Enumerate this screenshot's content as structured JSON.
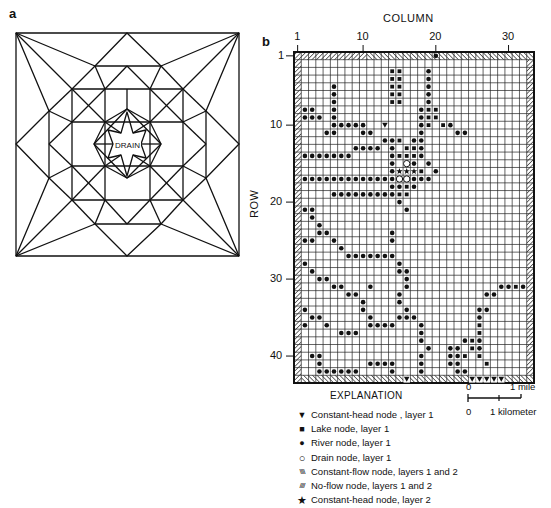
{
  "panels": {
    "a": {
      "label": "a",
      "drain_label": "DRAIN"
    },
    "b": {
      "label": "b",
      "column_title": "COLUMN",
      "row_title": "ROW",
      "n_rows": 43,
      "n_cols": 33,
      "column_ticks": [
        {
          "label": "1",
          "col": 1
        },
        {
          "label": "10",
          "col": 10
        },
        {
          "label": "20",
          "col": 20
        },
        {
          "label": "30",
          "col": 30
        }
      ],
      "row_ticks": [
        {
          "label": "1",
          "row": 1
        },
        {
          "label": "10",
          "row": 10
        },
        {
          "label": "20",
          "row": 20
        },
        {
          "label": "30",
          "row": 30
        },
        {
          "label": "40",
          "row": 40
        }
      ]
    }
  },
  "explanation": {
    "title": "EXPLANATION",
    "items": [
      {
        "symbol": "▼",
        "symbol_name": "constant-head-triangle-icon",
        "label": "Constant-head node , layer 1"
      },
      {
        "symbol": "■",
        "symbol_name": "lake-square-icon",
        "label": "Lake node, layer 1"
      },
      {
        "symbol": "●",
        "symbol_name": "river-dot-icon",
        "label": "River node, layer 1"
      },
      {
        "symbol": "○",
        "symbol_name": "drain-circle-icon",
        "label": "Drain node, layer 1"
      },
      {
        "symbol": "\\\\\\\\",
        "symbol_name": "constant-flow-hatch-icon",
        "label": "Constant-flow node, layers 1 and 2"
      },
      {
        "symbol": "////",
        "symbol_name": "no-flow-hatch-icon",
        "label": "No-flow node, layers 1 and 2"
      },
      {
        "symbol": "★",
        "symbol_name": "constant-head-star-icon",
        "label": "Constant-head node, layer 2"
      }
    ]
  },
  "scale_bar": {
    "mile_zero": "0",
    "mile_label": "1 mile",
    "km_zero": "0",
    "km_label": "1 kilometer"
  },
  "chart_data": {
    "type": "grid-map",
    "title": "",
    "xlabel": "COLUMN",
    "ylabel": "ROW",
    "x_range": [
      1,
      33
    ],
    "y_range": [
      1,
      43
    ],
    "boundary": {
      "constant_flow": "left column, right column, top row columns 1-10",
      "no_flow": "top row columns 11-33, bottom row"
    },
    "constant_head_layer1": [
      [
        10,
        13
      ],
      [
        43,
        16
      ],
      [
        43,
        25
      ],
      [
        43,
        26
      ],
      [
        43,
        27
      ],
      [
        43,
        28
      ],
      [
        43,
        29
      ]
    ],
    "constant_head_layer2": [
      [
        16,
        15
      ],
      [
        16,
        16
      ],
      [
        16,
        17
      ]
    ],
    "drain": [
      [
        15,
        16
      ],
      [
        17,
        15
      ],
      [
        17,
        16
      ]
    ],
    "lake": [
      [
        3,
        14
      ],
      [
        3,
        15
      ],
      [
        4,
        14
      ],
      [
        4,
        15
      ],
      [
        5,
        14
      ],
      [
        5,
        15
      ],
      [
        6,
        14
      ],
      [
        6,
        15
      ],
      [
        7,
        14
      ],
      [
        7,
        15
      ],
      [
        8,
        19
      ],
      [
        8,
        20
      ],
      [
        9,
        19
      ],
      [
        9,
        20
      ],
      [
        10,
        19
      ],
      [
        12,
        15
      ],
      [
        13,
        16
      ],
      [
        13,
        17
      ],
      [
        14,
        15
      ],
      [
        14,
        16
      ],
      [
        14,
        17
      ],
      [
        16,
        18
      ],
      [
        18,
        16
      ],
      [
        19,
        15
      ],
      [
        19,
        16
      ],
      [
        10,
        21
      ],
      [
        31,
        31
      ],
      [
        36,
        26
      ],
      [
        37,
        26
      ],
      [
        38,
        25
      ],
      [
        39,
        25
      ],
      [
        40,
        24
      ],
      [
        40,
        26
      ],
      [
        41,
        27
      ]
    ],
    "river": [
      [
        1,
        20
      ],
      [
        3,
        19
      ],
      [
        4,
        19
      ],
      [
        5,
        19
      ],
      [
        6,
        19
      ],
      [
        7,
        19
      ],
      [
        8,
        18
      ],
      [
        9,
        18
      ],
      [
        10,
        18
      ],
      [
        11,
        18
      ],
      [
        5,
        6
      ],
      [
        6,
        6
      ],
      [
        7,
        6
      ],
      [
        8,
        6
      ],
      [
        9,
        6
      ],
      [
        9,
        2
      ],
      [
        9,
        3
      ],
      [
        9,
        4
      ],
      [
        10,
        6
      ],
      [
        10,
        7
      ],
      [
        10,
        8
      ],
      [
        10,
        9
      ],
      [
        10,
        10
      ],
      [
        11,
        5
      ],
      [
        11,
        6
      ],
      [
        11,
        10
      ],
      [
        11,
        11
      ],
      [
        8,
        2
      ],
      [
        8,
        3
      ],
      [
        10,
        21
      ],
      [
        10,
        22
      ],
      [
        11,
        23
      ],
      [
        11,
        24
      ],
      [
        12,
        14
      ],
      [
        12,
        13
      ],
      [
        12,
        17
      ],
      [
        12,
        18
      ],
      [
        13,
        14
      ],
      [
        13,
        9
      ],
      [
        13,
        10
      ],
      [
        13,
        11
      ],
      [
        13,
        12
      ],
      [
        13,
        18
      ],
      [
        14,
        2
      ],
      [
        14,
        3
      ],
      [
        14,
        4
      ],
      [
        14,
        5
      ],
      [
        14,
        6
      ],
      [
        14,
        7
      ],
      [
        14,
        8
      ],
      [
        14,
        14
      ],
      [
        14,
        18
      ],
      [
        15,
        14
      ],
      [
        15,
        17
      ],
      [
        15,
        19
      ],
      [
        16,
        14
      ],
      [
        16,
        20
      ],
      [
        17,
        2
      ],
      [
        17,
        3
      ],
      [
        17,
        4
      ],
      [
        17,
        5
      ],
      [
        17,
        6
      ],
      [
        17,
        7
      ],
      [
        17,
        8
      ],
      [
        17,
        9
      ],
      [
        17,
        10
      ],
      [
        17,
        11
      ],
      [
        17,
        12
      ],
      [
        17,
        13
      ],
      [
        17,
        14
      ],
      [
        17,
        17
      ],
      [
        17,
        18
      ],
      [
        17,
        19
      ],
      [
        18,
        14
      ],
      [
        18,
        15
      ],
      [
        18,
        17
      ],
      [
        19,
        6
      ],
      [
        19,
        7
      ],
      [
        19,
        8
      ],
      [
        19,
        9
      ],
      [
        19,
        10
      ],
      [
        19,
        11
      ],
      [
        19,
        12
      ],
      [
        19,
        13
      ],
      [
        19,
        14
      ],
      [
        19,
        16
      ],
      [
        20,
        15
      ],
      [
        21,
        2
      ],
      [
        21,
        3
      ],
      [
        21,
        16
      ],
      [
        22,
        3
      ],
      [
        23,
        4
      ],
      [
        24,
        4
      ],
      [
        24,
        5
      ],
      [
        25,
        2
      ],
      [
        25,
        3
      ],
      [
        25,
        6
      ],
      [
        24,
        14
      ],
      [
        25,
        14
      ],
      [
        26,
        7
      ],
      [
        27,
        8
      ],
      [
        27,
        9
      ],
      [
        27,
        10
      ],
      [
        27,
        11
      ],
      [
        27,
        12
      ],
      [
        27,
        13
      ],
      [
        27,
        14
      ],
      [
        28,
        2
      ],
      [
        28,
        15
      ],
      [
        29,
        3
      ],
      [
        29,
        15
      ],
      [
        29,
        16
      ],
      [
        30,
        4
      ],
      [
        30,
        5
      ],
      [
        30,
        16
      ],
      [
        31,
        6
      ],
      [
        31,
        7
      ],
      [
        31,
        11
      ],
      [
        31,
        16
      ],
      [
        32,
        8
      ],
      [
        32,
        9
      ],
      [
        32,
        15
      ],
      [
        33,
        10
      ],
      [
        33,
        15
      ],
      [
        34,
        2
      ],
      [
        34,
        10
      ],
      [
        34,
        16
      ],
      [
        35,
        3
      ],
      [
        35,
        4
      ],
      [
        35,
        11
      ],
      [
        35,
        15
      ],
      [
        35,
        16
      ],
      [
        35,
        17
      ],
      [
        36,
        2
      ],
      [
        36,
        5
      ],
      [
        36,
        11
      ],
      [
        36,
        12
      ],
      [
        36,
        13
      ],
      [
        36,
        14
      ],
      [
        36,
        18
      ],
      [
        37,
        7
      ],
      [
        37,
        8
      ],
      [
        37,
        9
      ],
      [
        37,
        18
      ],
      [
        38,
        18
      ],
      [
        39,
        19
      ],
      [
        40,
        3
      ],
      [
        40,
        4
      ],
      [
        40,
        18
      ],
      [
        40,
        23
      ],
      [
        41,
        4
      ],
      [
        41,
        11
      ],
      [
        41,
        12
      ],
      [
        41,
        13
      ],
      [
        41,
        14
      ],
      [
        41,
        18
      ],
      [
        42,
        4
      ],
      [
        42,
        5
      ],
      [
        42,
        6
      ],
      [
        42,
        7
      ],
      [
        42,
        8
      ],
      [
        42,
        9
      ],
      [
        42,
        14
      ],
      [
        42,
        18
      ],
      [
        42,
        23
      ],
      [
        42,
        24
      ],
      [
        34,
        26
      ],
      [
        34,
        27
      ],
      [
        35,
        26
      ],
      [
        36,
        26
      ],
      [
        37,
        26
      ],
      [
        38,
        24
      ],
      [
        38,
        26
      ],
      [
        39,
        22
      ],
      [
        39,
        23
      ],
      [
        39,
        25
      ],
      [
        39,
        26
      ],
      [
        40,
        22
      ],
      [
        41,
        22
      ],
      [
        41,
        23
      ],
      [
        32,
        27
      ],
      [
        32,
        28
      ],
      [
        31,
        29
      ],
      [
        31,
        30
      ],
      [
        31,
        31
      ],
      [
        31,
        32
      ]
    ]
  }
}
